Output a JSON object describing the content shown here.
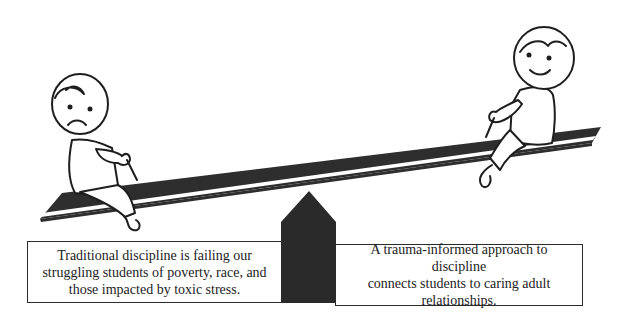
{
  "diagram": {
    "type": "seesaw-metaphor",
    "colors": {
      "board": "#2e2e2e",
      "fulcrum": "#2a2a2a",
      "outline": "#1e1e1e",
      "background": "#ffffff"
    },
    "left_child": {
      "expression": "sad",
      "position": "low end"
    },
    "right_child": {
      "expression": "happy",
      "position": "high end"
    },
    "captions": {
      "left": {
        "lines": [
          "Traditional discipline is failing our",
          "struggling students of poverty, race, and",
          "those impacted by toxic stress."
        ]
      },
      "right": {
        "lines": [
          "A trauma-informed approach to discipline",
          "connects students to caring adult",
          "relationships."
        ]
      }
    }
  }
}
